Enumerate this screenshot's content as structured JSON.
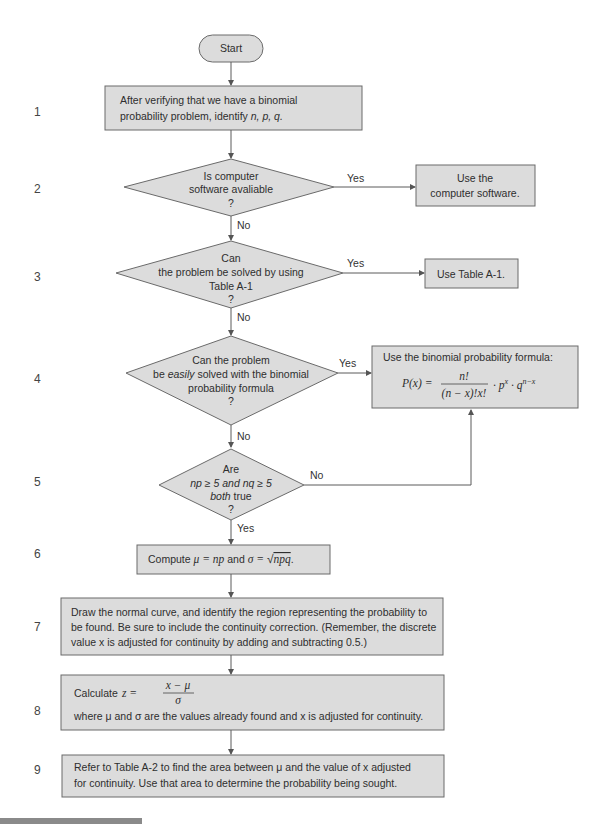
{
  "flowchart": {
    "start": {
      "label": "Start"
    },
    "step_numbers": [
      "1",
      "2",
      "3",
      "4",
      "5",
      "6",
      "7",
      "8",
      "9"
    ],
    "step1": {
      "line1": "After verifying that we have a binomial",
      "line2": "probability problem, identify ",
      "vars": "n, p, q."
    },
    "step2": {
      "question": [
        "Is computer",
        "software avaliable",
        "?"
      ],
      "yes_label": "Yes",
      "no_label": "No",
      "yes_action": [
        "Use the",
        "computer software."
      ]
    },
    "step3": {
      "question": [
        "Can",
        "the problem be solved by using",
        "Table A-1",
        "?"
      ],
      "yes_label": "Yes",
      "no_label": "No",
      "yes_action": "Use Table A-1."
    },
    "step4": {
      "question": [
        "Can the problem",
        "be ",
        "easily",
        " solved with the binomial",
        "probability formula",
        "?"
      ],
      "yes_label": "Yes",
      "no_label": "No",
      "yes_action_title": "Use the binomial probability formula:",
      "formula": {
        "lhs": "P(x) =",
        "numerator": "n!",
        "denominator": "(n − x)!x!",
        "tail": "· p",
        "tail_sup1": "x",
        "tail2": " · q",
        "tail_sup2": "n−x"
      }
    },
    "step5": {
      "question": [
        "Are",
        "np ≥ 5 and nq ≥ 5",
        "both",
        " true",
        "?"
      ],
      "yes_label": "Yes",
      "no_label": "No"
    },
    "step6": {
      "text_pre": "Compute ",
      "mu_eq": "μ = np",
      "and": " and ",
      "sigma_eq": "σ = ",
      "sqrt_arg": "npq",
      "end": "."
    },
    "step7": {
      "lines": [
        "Draw the normal curve, and identify the region representing the probability to",
        "be found. Be sure to include the continuity correction. (Remember, the discrete",
        "value x is adjusted for continuity by adding and subtracting 0.5.)"
      ]
    },
    "step8": {
      "label": "Calculate",
      "z_lhs": "z =",
      "z_num": "x − μ",
      "z_den": "σ",
      "note": "where μ and σ are the values already found and x is adjusted for continuity."
    },
    "step9": {
      "lines": [
        "Refer to Table A-2 to find the area between μ and the value of x adjusted",
        "for continuity. Use that area to determine the probability being sought."
      ]
    }
  },
  "colors": {
    "box_fill": "#dcdcdc",
    "stroke": "#6a6a6a",
    "text": "#2e2e2e"
  }
}
